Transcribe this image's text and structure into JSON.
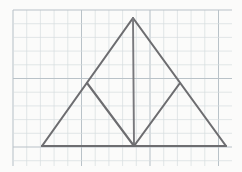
{
  "canvas": {
    "width": 242,
    "height": 172,
    "background_color": "#fdfdfd",
    "title": "Isosceles triangle subdivided into four triangles on graph paper"
  },
  "grid": {
    "label": "graph-paper-grid",
    "cell_size": 13.7,
    "minor_color": "#d6dce0",
    "major_color": "#b9c2c8",
    "major_every": 5,
    "x_start": 13,
    "x_end": 232,
    "y_start": 10,
    "y_end": 166,
    "visible": true
  },
  "figure": {
    "label": "subdivided-isosceles-triangle",
    "stroke_color": "#6d6d70",
    "stroke_width": 2.1,
    "points": {
      "apex": {
        "name": "apex",
        "x": 133,
        "y": 18
      },
      "bottom_left": {
        "name": "bottom-left-vertex",
        "x": 42,
        "y": 146
      },
      "bottom_right": {
        "name": "bottom-right-vertex",
        "x": 226,
        "y": 146
      },
      "base_midpoint": {
        "name": "base-midpoint",
        "x": 134,
        "y": 146
      },
      "left_leg_midpoint": {
        "name": "left-leg-midpoint",
        "x": 87,
        "y": 83
      },
      "right_leg_midpoint": {
        "name": "right-leg-midpoint",
        "x": 180,
        "y": 83
      }
    },
    "segments": [
      {
        "name": "left-leg",
        "path": "M 42 146 L 133 18"
      },
      {
        "name": "right-leg",
        "path": "M 133 18 L 226 146"
      },
      {
        "name": "base",
        "path": "M 42 146 L 226 146"
      },
      {
        "name": "altitude-median",
        "path": "M 133 18 L 134 146"
      },
      {
        "name": "left-midsegment",
        "path": "M 87 83 L 134 146"
      },
      {
        "name": "right-midsegment",
        "path": "M 180 83 L 134 146"
      }
    ],
    "region_count": 4
  },
  "chart_data": {
    "type": "diagram",
    "shapes": [
      {
        "name": "outer-triangle",
        "kind": "triangle",
        "vertices": [
          [
            42,
            146
          ],
          [
            133,
            18
          ],
          [
            226,
            146
          ]
        ]
      },
      {
        "name": "left-outer-small-triangle",
        "kind": "triangle",
        "vertices": [
          [
            42,
            146
          ],
          [
            87,
            83
          ],
          [
            134,
            146
          ]
        ]
      },
      {
        "name": "left-inner-small-triangle",
        "kind": "triangle",
        "vertices": [
          [
            87,
            83
          ],
          [
            133,
            18
          ],
          [
            134,
            146
          ]
        ]
      },
      {
        "name": "right-inner-small-triangle",
        "kind": "triangle",
        "vertices": [
          [
            133,
            18
          ],
          [
            180,
            83
          ],
          [
            134,
            146
          ]
        ]
      },
      {
        "name": "right-outer-small-triangle",
        "kind": "triangle",
        "vertices": [
          [
            180,
            83
          ],
          [
            226,
            146
          ],
          [
            134,
            146
          ]
        ]
      }
    ],
    "xlim": [
      0,
      242
    ],
    "ylim": [
      0,
      172
    ],
    "grid": true,
    "legend": false,
    "xlabel": "",
    "ylabel": ""
  }
}
